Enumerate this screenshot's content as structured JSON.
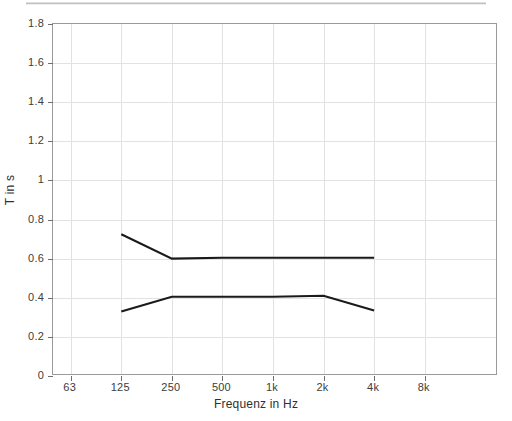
{
  "chart_data": {
    "type": "line",
    "title": "",
    "subtitle": "",
    "xlabel": "Frequenz in Hz",
    "ylabel": "T in s",
    "categories": [
      "63",
      "125",
      "250",
      "500",
      "1k",
      "2k",
      "4k",
      "8k"
    ],
    "x_tick_labels": [
      "63",
      "125",
      "250",
      "500",
      "1k",
      "2k",
      "4k",
      "8k"
    ],
    "y_tick_labels": [
      "1.8",
      "1.6",
      "1.4",
      "1.2",
      "1",
      "0.8",
      "0.6",
      "0.4",
      "0.2",
      "0"
    ],
    "y_tick_values": [
      1.8,
      1.6,
      1.4,
      1.2,
      1.0,
      0.8,
      0.6,
      0.4,
      0.2,
      0.0
    ],
    "ylim": [
      0,
      1.8
    ],
    "xlim_categories": [
      "63",
      "8k"
    ],
    "grid": true,
    "legend": null,
    "legend_position": "none",
    "line_color": "#1a1a1a",
    "grid_color": "#e2e2e2",
    "axis_color": "#9a9a9a",
    "series": [
      {
        "name": "upper-tolerance-curve",
        "x": [
          "125",
          "250",
          "500",
          "1k",
          "2k",
          "4k"
        ],
        "values": [
          0.725,
          0.6,
          0.605,
          0.605,
          0.605,
          0.605
        ]
      },
      {
        "name": "lower-tolerance-curve",
        "x": [
          "125",
          "250",
          "500",
          "1k",
          "2k",
          "4k"
        ],
        "values": [
          0.33,
          0.405,
          0.405,
          0.405,
          0.41,
          0.335
        ]
      }
    ],
    "annotations": []
  },
  "figure": {
    "background_color": "#ffffff"
  }
}
